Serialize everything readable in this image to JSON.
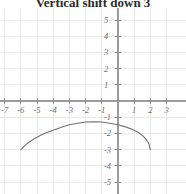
{
  "title": "Vertical shift down 3",
  "chart_data": {
    "type": "line",
    "title": "Vertical shift down 3",
    "xlabel": "",
    "ylabel": "",
    "xlim": [
      -7.4,
      3.2
    ],
    "ylim": [
      -5.4,
      5.3
    ],
    "grid": true,
    "legend": null,
    "x_ticks": [
      -7,
      -6,
      -5,
      -4,
      -3,
      -2,
      -1,
      1,
      2,
      3
    ],
    "x_tick_labels": [
      "-7",
      "-6",
      "-5",
      "-4",
      "-3",
      "-2",
      "-1",
      "1",
      "2",
      "3"
    ],
    "y_ticks": [
      5,
      4,
      3,
      2,
      1,
      -1,
      -2,
      -3,
      -4,
      -5
    ],
    "y_tick_labels": [
      "5",
      "4",
      "3",
      "2",
      "1",
      "-1",
      "-2",
      "-3",
      "-4",
      "-5"
    ],
    "series": [
      {
        "name": "shifted curve",
        "description": "downward-opening arc, apex near (-2, -1), endpoints near (-6, -3) and (2, -3)",
        "x": [
          -6.0,
          -5.6,
          -5.2,
          -4.8,
          -4.4,
          -4.0,
          -3.5,
          -3.0,
          -2.5,
          -2.0,
          -1.5,
          -1.0,
          -0.5,
          0.0,
          0.4,
          0.8,
          1.2,
          1.5,
          1.7,
          1.9,
          2.0
        ],
        "y": [
          -3.0,
          -2.62,
          -2.35,
          -2.13,
          -1.95,
          -1.8,
          -1.62,
          -1.47,
          -1.37,
          -1.3,
          -1.28,
          -1.3,
          -1.37,
          -1.47,
          -1.58,
          -1.72,
          -1.92,
          -2.12,
          -2.32,
          -2.62,
          -3.0
        ]
      }
    ]
  },
  "geometry": {
    "origin_x": 118,
    "origin_y": 93,
    "unit_px": 16.2
  }
}
